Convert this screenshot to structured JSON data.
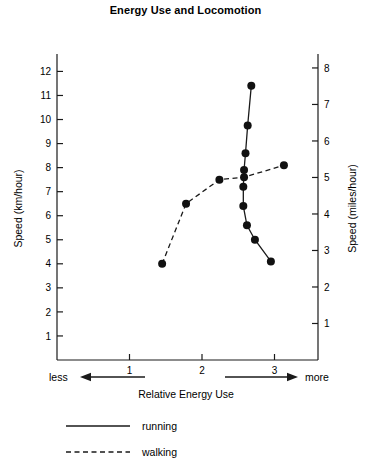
{
  "chart_data": {
    "type": "line",
    "title": "Energy Use and Locomotion",
    "xlabel": "Relative Energy Use",
    "ylabel": "Speed (km/hour)",
    "y2label": "Speed (miles/hour)",
    "xlim": [
      0.0,
      3.6
    ],
    "ylim": [
      0,
      12.6
    ],
    "y2lim": [
      0,
      8.3
    ],
    "xticks": [
      1,
      2,
      3
    ],
    "yticks": [
      1,
      2,
      3,
      4,
      5,
      6,
      7,
      8,
      9,
      10,
      11,
      12
    ],
    "y2ticks": [
      1,
      2,
      3,
      4,
      5,
      6,
      7,
      8
    ],
    "grid": false,
    "legend_position": "bottom-left",
    "x_axis_annotations": {
      "left_label": "less",
      "right_label": "more"
    },
    "series": [
      {
        "name": "running",
        "style": "solid",
        "marker": "filled-circle",
        "points": [
          {
            "x": 2.68,
            "y": 11.4
          },
          {
            "x": 2.63,
            "y": 9.75
          },
          {
            "x": 2.6,
            "y": 8.6
          },
          {
            "x": 2.58,
            "y": 7.9
          },
          {
            "x": 2.57,
            "y": 7.2
          },
          {
            "x": 2.57,
            "y": 6.4
          },
          {
            "x": 2.62,
            "y": 5.6
          },
          {
            "x": 2.73,
            "y": 5.0
          },
          {
            "x": 2.95,
            "y": 4.1
          }
        ]
      },
      {
        "name": "walking",
        "style": "dashed",
        "marker": "filled-circle",
        "points": [
          {
            "x": 1.45,
            "y": 4.0
          },
          {
            "x": 1.78,
            "y": 6.5
          },
          {
            "x": 2.24,
            "y": 7.5
          },
          {
            "x": 2.58,
            "y": 7.6
          },
          {
            "x": 3.13,
            "y": 8.1
          }
        ]
      }
    ]
  },
  "legend": {
    "items": [
      {
        "label": "running",
        "style": "solid"
      },
      {
        "label": "walking",
        "style": "dashed"
      }
    ]
  }
}
